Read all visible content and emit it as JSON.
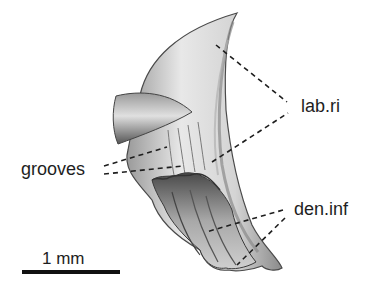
{
  "figure": {
    "labels": {
      "labial_ridge": "lab.ri",
      "grooves": "grooves",
      "dentary_infolding": "den.inf"
    },
    "scale_bar": {
      "label": "1 mm",
      "length_px": 98
    },
    "colors": {
      "background": "#ffffff",
      "ink": "#1e1e1e",
      "tooth_light": "#e6e6e6",
      "tooth_mid": "#b4b4b4",
      "tooth_dark": "#5a5a5a"
    }
  }
}
